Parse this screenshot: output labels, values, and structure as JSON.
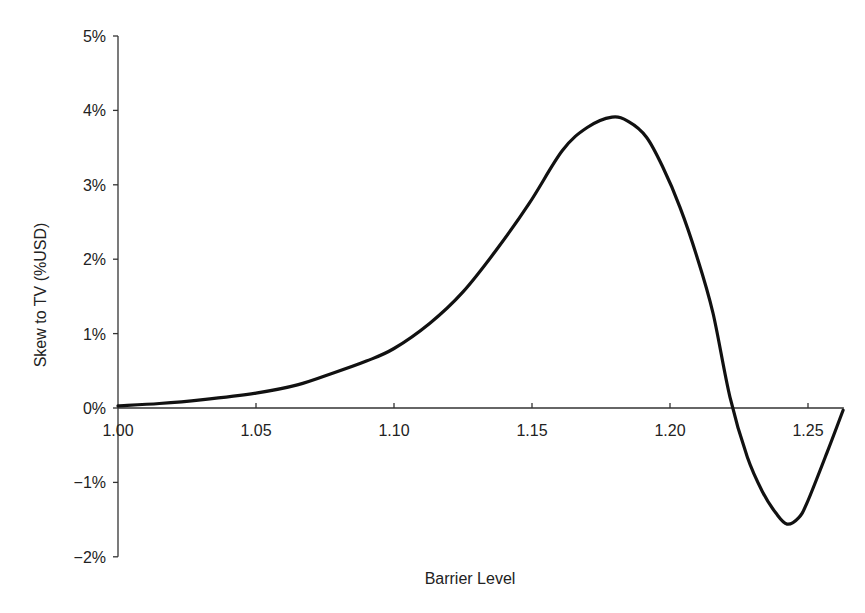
{
  "chart_data": {
    "type": "line",
    "title": "",
    "xlabel": "Barrier Level",
    "ylabel": "Skew to TV (%USD)",
    "xlim": [
      1.0,
      1.263
    ],
    "ylim": [
      -2,
      5
    ],
    "xticks": [
      1.0,
      1.05,
      1.1,
      1.15,
      1.2,
      1.25
    ],
    "xtick_labels": [
      "1.00",
      "1.05",
      "1.10",
      "1.15",
      "1.20",
      "1.25"
    ],
    "yticks": [
      -2,
      -1,
      0,
      1,
      2,
      3,
      4,
      5
    ],
    "ytick_labels": [
      "−2%",
      "−1%",
      "0%",
      "1%",
      "2%",
      "3%",
      "4%",
      "5%"
    ],
    "grid": false,
    "legend": null,
    "series": [
      {
        "name": "Skew to TV",
        "color": "#111111",
        "x": [
          1.0,
          1.015,
          1.03,
          1.05,
          1.065,
          1.078,
          1.09,
          1.1,
          1.113,
          1.125,
          1.137,
          1.149,
          1.161,
          1.17,
          1.179,
          1.185,
          1.1915,
          1.1975,
          1.2036,
          1.2098,
          1.2156,
          1.2217,
          1.228,
          1.2337,
          1.2385,
          1.2424,
          1.2465,
          1.2496,
          1.2569,
          1.2627
        ],
        "values": [
          0.03,
          0.06,
          0.11,
          0.2,
          0.31,
          0.47,
          0.63,
          0.8,
          1.14,
          1.56,
          2.12,
          2.75,
          3.46,
          3.77,
          3.91,
          3.85,
          3.64,
          3.23,
          2.7,
          2.03,
          1.27,
          0.15,
          -0.66,
          -1.14,
          -1.42,
          -1.56,
          -1.48,
          -1.28,
          -0.6,
          -0.03
        ]
      }
    ],
    "annotations": []
  }
}
